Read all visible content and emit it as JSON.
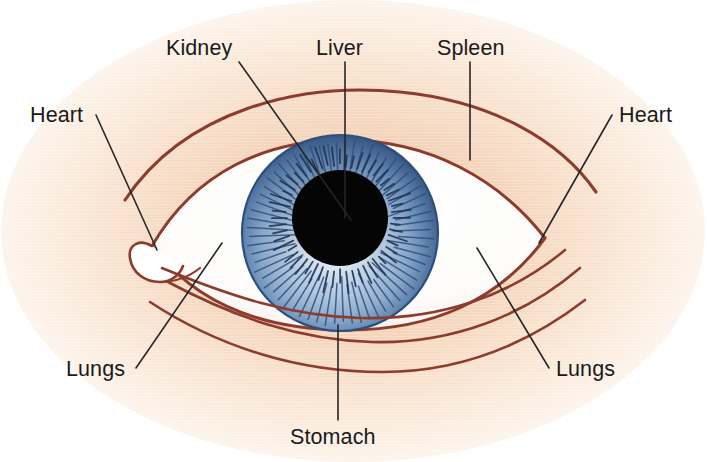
{
  "figure": {
    "width": 707,
    "height": 462,
    "background_color": "#ffffff"
  },
  "colors": {
    "background": "#ffffff",
    "skin_peach_light": "#fbeadb",
    "skin_peach_mid": "#f6d9c0",
    "skin_peach_deep": "#efc3a2",
    "line_maroon": "#8d3b2c",
    "leader_line": "#262626",
    "label_text": "#1a1a1a",
    "sclera_white": "#ffffff",
    "iris_rim_blue": "#3d5f8f",
    "iris_mid_blue": "#7f9fc4",
    "iris_inner_light": "#dfeaf4",
    "iris_stria": "#2f4f7d",
    "pupil_black": "#050505"
  },
  "labels": [
    {
      "id": "kidney",
      "text": "Kidney",
      "text_x": 166,
      "text_y": 55,
      "anchor": "start",
      "leader": {
        "x1": 239,
        "y1": 62,
        "x2": 351,
        "y2": 220
      }
    },
    {
      "id": "liver",
      "text": "Liver",
      "text_x": 316,
      "text_y": 55,
      "anchor": "start",
      "leader": {
        "x1": 345,
        "y1": 62,
        "x2": 345,
        "y2": 218
      }
    },
    {
      "id": "spleen",
      "text": "Spleen",
      "text_x": 437,
      "text_y": 55,
      "anchor": "start",
      "leader": {
        "x1": 470,
        "y1": 62,
        "x2": 470,
        "y2": 160
      }
    },
    {
      "id": "heart-left",
      "text": "Heart",
      "text_x": 30,
      "text_y": 122,
      "anchor": "start",
      "leader": {
        "x1": 96,
        "y1": 115,
        "x2": 157,
        "y2": 250
      }
    },
    {
      "id": "heart-right",
      "text": "Heart",
      "text_x": 619,
      "text_y": 122,
      "anchor": "start",
      "leader": {
        "x1": 612,
        "y1": 115,
        "x2": 539,
        "y2": 243
      }
    },
    {
      "id": "lungs-left",
      "text": "Lungs",
      "text_x": 66,
      "text_y": 376,
      "anchor": "start",
      "leader": {
        "x1": 136,
        "y1": 368,
        "x2": 222,
        "y2": 243
      }
    },
    {
      "id": "lungs-right",
      "text": "Lungs",
      "text_x": 556,
      "text_y": 376,
      "anchor": "start",
      "leader": {
        "x1": 549,
        "y1": 368,
        "x2": 477,
        "y2": 248
      }
    },
    {
      "id": "stomach",
      "text": "Stomach",
      "text_x": 290,
      "text_y": 444,
      "anchor": "start",
      "leader": {
        "x1": 338,
        "y1": 420,
        "x2": 338,
        "y2": 325
      }
    }
  ],
  "eye": {
    "iris": {
      "cx": 340,
      "cy": 233,
      "r": 98
    },
    "pupil": {
      "cx": 340,
      "cy": 218,
      "r": 48
    },
    "stria_count_outer": 64,
    "stria_count_inner": 56
  },
  "anatomy_parts": [
    "Kidney",
    "Liver",
    "Spleen",
    "Heart",
    "Lungs",
    "Stomach"
  ]
}
